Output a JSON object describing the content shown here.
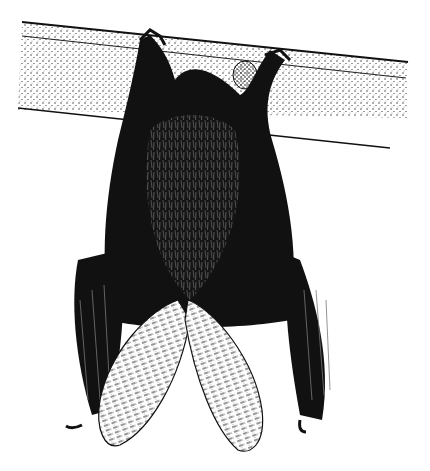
{
  "image": {
    "subject": "bat hanging upside down from a wooden beam",
    "style": "black and white stipple pen-and-ink illustration",
    "background": "#ffffff",
    "ink": "#111111"
  }
}
